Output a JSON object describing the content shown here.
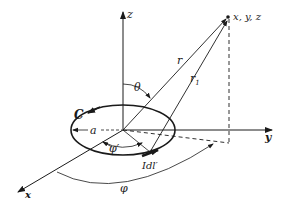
{
  "diagram": {
    "axes": {
      "z_label": "z",
      "y_label": "y",
      "x_label": "x"
    },
    "point_label": "x, y, z",
    "vectors": {
      "r_label": "r",
      "r1_label": "r",
      "r1_subscript": "1"
    },
    "angles": {
      "theta_label": "θ",
      "phi_prime_label": "φ′",
      "phi_label": "φ"
    },
    "loop": {
      "contour_label": "C",
      "radius_label": "a",
      "element_label": "Idl′"
    },
    "colors": {
      "ink": "#1a1a1a",
      "background": "#ffffff"
    }
  }
}
